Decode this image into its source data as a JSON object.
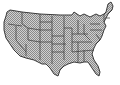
{
  "map": {
    "subject": "United States (contiguous 48 states)",
    "style": "hatched checker fill with dark state borders",
    "colors": {
      "background": "#ffffff",
      "fill_light": "#d0d0d0",
      "fill_dark": "#8a8a8a",
      "border": "#3a3a3a"
    }
  }
}
